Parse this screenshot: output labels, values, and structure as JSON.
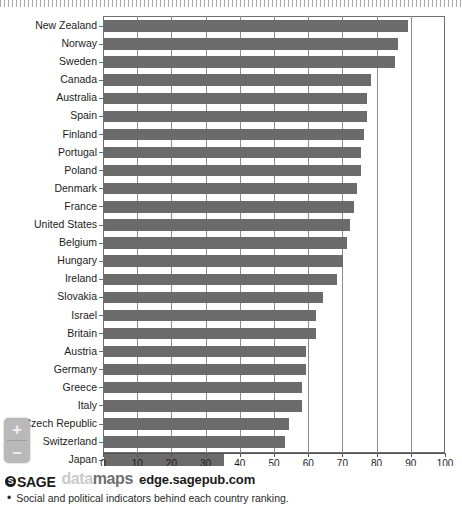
{
  "chart_data": {
    "type": "bar",
    "orientation": "horizontal",
    "title": "",
    "xlabel": "",
    "ylabel": "",
    "xlim": [
      0,
      100
    ],
    "xticks": [
      0,
      10,
      20,
      30,
      40,
      50,
      60,
      70,
      80,
      90,
      100
    ],
    "grid": true,
    "legend": null,
    "bar_color": "#6b6b6b",
    "categories": [
      "New Zealand",
      "Norway",
      "Sweden",
      "Canada",
      "Australia",
      "Spain",
      "Finland",
      "Portugal",
      "Poland",
      "Denmark",
      "France",
      "United States",
      "Belgium",
      "Hungary",
      "Ireland",
      "Slovakia",
      "Israel",
      "Britain",
      "Austria",
      "Germany",
      "Greece",
      "Italy",
      "Czech Republic",
      "Switzerland",
      "Japan",
      "South Korea"
    ],
    "values": [
      89,
      86,
      85,
      78,
      77,
      77,
      76,
      75,
      75,
      74,
      73,
      72,
      71,
      70,
      68,
      64,
      62,
      62,
      59,
      59,
      58,
      58,
      54,
      53,
      35,
      14
    ]
  },
  "xaxis": {
    "ticks": [
      "0",
      "10",
      "20",
      "30",
      "40",
      "50",
      "60",
      "70",
      "80",
      "90",
      "100"
    ]
  },
  "zoom_control": {
    "zoom_in_label": "+",
    "zoom_out_label": "–"
  },
  "footer": {
    "sage_glyph": "S",
    "sage_label": "SAGE",
    "datamaps_first": "data",
    "datamaps_second": "maps",
    "url": "edge.sagepub.com",
    "bullet": "•",
    "note": "Social and political indicators behind each country ranking."
  }
}
